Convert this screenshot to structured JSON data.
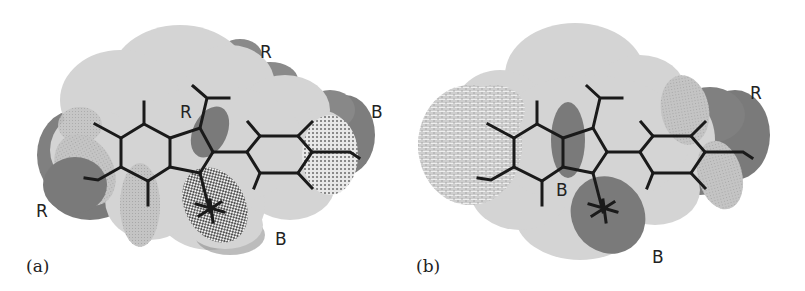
{
  "figure": {
    "panels": [
      {
        "id": "a",
        "caption": "(a)",
        "region_labels": [
          {
            "text": "R",
            "kind": "red-region"
          },
          {
            "text": "R",
            "kind": "red-region"
          },
          {
            "text": "B",
            "kind": "blue-region"
          },
          {
            "text": "R",
            "kind": "red-region"
          },
          {
            "text": "B",
            "kind": "blue-region"
          }
        ]
      },
      {
        "id": "b",
        "caption": "(b)",
        "region_labels": [
          {
            "text": "R",
            "kind": "red-region"
          },
          {
            "text": "B",
            "kind": "blue-region"
          },
          {
            "text": "B",
            "kind": "blue-region"
          }
        ]
      }
    ],
    "colors": {
      "surface_light": "#d6d6d6",
      "surface_mid": "#bdbdbd",
      "region_dark": "#7d7d7d",
      "bond": "#1a1a1a"
    }
  }
}
